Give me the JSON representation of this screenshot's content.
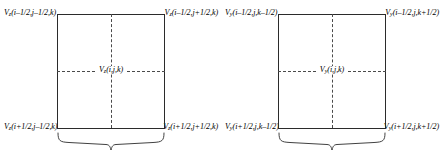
{
  "diagram": {
    "line_color": "#2b2b2b",
    "dash_color": "#4a4a4a",
    "background": "#ffffff",
    "groups": [
      {
        "name": "xy-face-cell",
        "corners": {
          "top_left": "V_z(i–1/2,j–1/2,k)",
          "top_right": "V_z(i–1/2,j+1/2,k)",
          "bottom_left": "V_z(i+1/2,j–1/2,k)",
          "bottom_right": "V_z(i+1/2,j+1/2,k)"
        },
        "center": "V_z(i,j,k)"
      },
      {
        "name": "xz-face-cell",
        "corners": {
          "top_left": "V_y(i–1/2,j,k–1/2)",
          "top_right": "V_y(i–1/2,j,k+1/2)",
          "bottom_left": "V_y(i+1/2,j,k–1/2)",
          "bottom_right": "V_y(i+1/2,j,k+1/2)"
        },
        "center": "V_y(i,j,k)"
      }
    ],
    "labels": {
      "g1_tl_v": "V",
      "g1_tl_sub": "z",
      "g1_tl_arg": "(i–1/2,j–1/2,k)",
      "g1_tr_v": "V",
      "g1_tr_sub": "z",
      "g1_tr_arg": "(i–1/2,j+1/2,k)",
      "g1_bl_v": "V",
      "g1_bl_sub": "z",
      "g1_bl_arg": "(i+1/2,j–1/2,k)",
      "g1_br_v": "V",
      "g1_br_sub": "z",
      "g1_br_arg": "(i+1/2,j+1/2,k)",
      "g1_c_v": "V",
      "g1_c_sub": "z",
      "g1_c_arg": "(i,j,k)",
      "g2_tl_v": "V",
      "g2_tl_sub": "y",
      "g2_tl_arg": "(i–1/2,j,k–1/2)",
      "g2_tr_v": "V",
      "g2_tr_sub": "y",
      "g2_tr_arg": "(i–1/2,j,k+1/2)",
      "g2_bl_v": "V",
      "g2_bl_sub": "y",
      "g2_bl_arg": "(i+1/2,j,k–1/2)",
      "g2_br_v": "V",
      "g2_br_sub": "y",
      "g2_br_arg": "(i+1/2,j,k+1/2)",
      "g2_c_v": "V",
      "g2_c_sub": "y",
      "g2_c_arg": "(i,j,k)"
    }
  }
}
